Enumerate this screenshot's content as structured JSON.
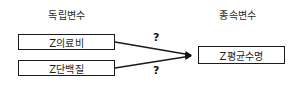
{
  "diagram": {
    "type": "path-diagram",
    "headers": {
      "independent": "독립변수",
      "dependent": "종속변수"
    },
    "nodes": [
      {
        "id": "medical",
        "label": "Z의료비",
        "group": "independent"
      },
      {
        "id": "protein",
        "label": "Z단백질",
        "group": "independent"
      },
      {
        "id": "lifespan",
        "label": "Z평균수명",
        "group": "dependent"
      }
    ],
    "edges": [
      {
        "from": "medical",
        "to": "lifespan",
        "label": "?"
      },
      {
        "from": "protein",
        "to": "lifespan",
        "label": "?"
      }
    ],
    "colors": {
      "line": "#1a1a1a",
      "text": "#1f1f1f",
      "header_text": "#2b2b2b",
      "background": "#ffffff"
    }
  }
}
